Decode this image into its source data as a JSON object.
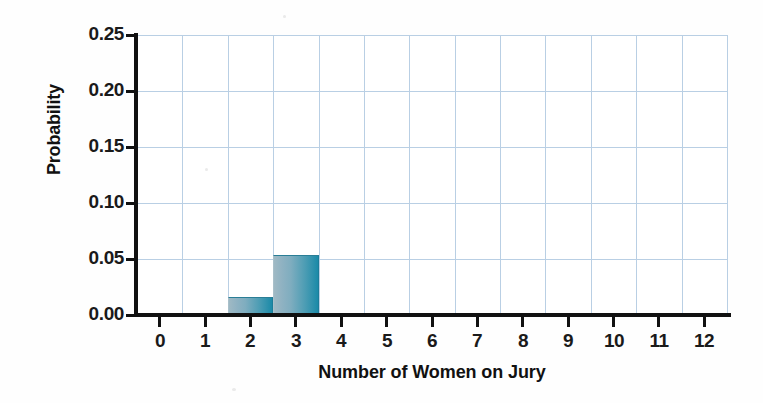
{
  "chart_data": {
    "type": "bar",
    "title": "",
    "xlabel": "Number of Women on Jury",
    "ylabel": "Probability",
    "categories": [
      "0",
      "1",
      "2",
      "3",
      "4",
      "5",
      "6",
      "7",
      "8",
      "9",
      "10",
      "11",
      "12"
    ],
    "values": [
      0.0,
      0.002,
      0.016,
      0.054,
      0.0,
      0.0,
      0.0,
      0.0,
      0.0,
      0.0,
      0.0,
      0.0,
      0.0
    ],
    "xlim": [
      -0.5,
      12.5
    ],
    "ylim": [
      0.0,
      0.25
    ],
    "y_ticks": [
      0.0,
      0.05,
      0.1,
      0.15,
      0.2,
      0.25
    ],
    "y_tick_labels": [
      "0.00",
      "0.05",
      "0.10",
      "0.15",
      "0.20",
      "0.25"
    ],
    "x_ticks": [
      0,
      1,
      2,
      3,
      4,
      5,
      6,
      7,
      8,
      9,
      10,
      11,
      12
    ],
    "x_tick_labels": [
      "0",
      "1",
      "2",
      "3",
      "4",
      "5",
      "6",
      "7",
      "8",
      "9",
      "10",
      "11",
      "12"
    ],
    "grid": true,
    "grid_color": "#b9cfe4",
    "bar_color_left": "#9fb9c4",
    "bar_color_right": "#1b8aa8",
    "axis_color": "#111111",
    "background_color": "#ffffff",
    "legend": null,
    "bin_width": 1
  }
}
